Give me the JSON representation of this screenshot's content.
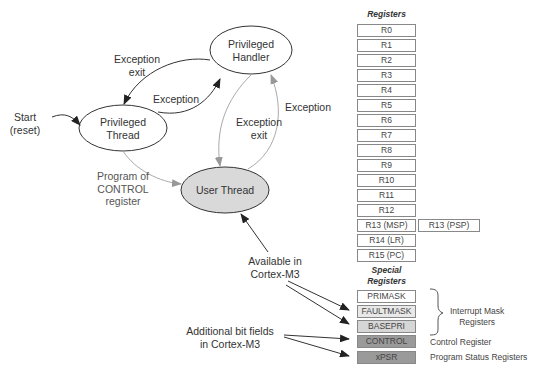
{
  "states": {
    "privileged_handler": [
      "Privileged",
      "Handler"
    ],
    "privileged_thread": [
      "Privileged",
      "Thread"
    ],
    "user_thread": "User Thread"
  },
  "transitions": {
    "start": [
      "Start",
      "(reset)"
    ],
    "exception_exit_top": [
      "Exception",
      "exit"
    ],
    "exception_top": "Exception",
    "exception_exit_mid": [
      "Exception",
      "exit"
    ],
    "exception_right": "Exception",
    "program_control": [
      "Program of",
      "CONTROL",
      "register"
    ]
  },
  "annotations": {
    "available": [
      "Available in",
      "Cortex-M3"
    ],
    "additional": [
      "Additional bit fields",
      "in Cortex-M3"
    ]
  },
  "registers": {
    "header": "Registers",
    "general": [
      "R0",
      "R1",
      "R2",
      "R3",
      "R4",
      "R5",
      "R6",
      "R7",
      "R8",
      "R9",
      "R10",
      "R11",
      "R12",
      "R13 (MSP)",
      "R14 (LR)",
      "R15 (PC)"
    ],
    "banked": "R13 (PSP)",
    "special_header": [
      "Special",
      "Registers"
    ],
    "special": [
      "PRIMASK",
      "FAULTMASK",
      "BASEPRI",
      "CONTROL",
      "xPSR"
    ],
    "groups": {
      "interrupt_mask": [
        "Interrupt Mask",
        "Registers"
      ],
      "control": "Control Register",
      "status": "Program Status Registers"
    }
  },
  "colors": {
    "user_thread_fill": "#d9d9d9",
    "gray_arrow": "#aaaaaa",
    "dark_arrow": "#333333",
    "special_light": "#e8e8e8",
    "special_dark": "#9a9a9a"
  }
}
